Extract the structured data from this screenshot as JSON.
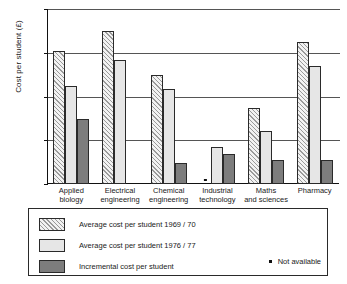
{
  "chart_data": {
    "type": "bar",
    "title": "",
    "xlabel": "",
    "ylabel": "Cost per student (£)",
    "ylim": [
      0,
      4000
    ],
    "yticks": [
      0,
      1000,
      2000,
      3000,
      4000
    ],
    "ytick_labels": [
      "0",
      "1000",
      "2000",
      "3000",
      "4000"
    ],
    "grid": true,
    "legend_position": "below-plot-boxed",
    "categories": [
      "Applied biology",
      "Electrical engineering",
      "Chemical engineering",
      "Industrial technology",
      "Maths and sciences",
      "Pharmacy"
    ],
    "category_lines": [
      [
        "Applied",
        "biology"
      ],
      [
        "Electrical",
        "engineering"
      ],
      [
        "Chemical",
        "engineering"
      ],
      [
        "Industrial",
        "technology"
      ],
      [
        "Maths",
        "and sciences"
      ],
      [
        "Pharmacy",
        ""
      ]
    ],
    "series": [
      {
        "name": "Average cost per student  1969 / 70",
        "key": "avg1969",
        "pattern": "diagonal-hatch",
        "values": [
          3030,
          3500,
          2500,
          null,
          1730,
          3250
        ]
      },
      {
        "name": "Average cost per student  1976 / 77",
        "key": "avg1976",
        "pattern": "fine-grid",
        "values": [
          2250,
          2840,
          2170,
          850,
          1220,
          2700
        ]
      },
      {
        "name": "Incremental cost per student",
        "key": "incremental",
        "pattern": "solid-grey",
        "values": [
          1490,
          null,
          470,
          690,
          560,
          560
        ]
      }
    ],
    "annotations": [
      {
        "text": "Not available",
        "marker": "dot",
        "applies_to": "Industrial technology 1969 / 70"
      }
    ]
  },
  "legend": {
    "items": [
      {
        "label": "Average cost per student  1969 / 70",
        "pattern": "diagonal-hatch"
      },
      {
        "label": "Average cost per student  1976 / 77",
        "pattern": "fine-grid"
      },
      {
        "label": "Incremental cost per student",
        "pattern": "solid-grey"
      }
    ],
    "note": "Not available"
  },
  "colors": {
    "axis": "#111111",
    "grid": "#555555",
    "hatch": "#9a9a9a",
    "fine_grid_fill": "#e6e6e6",
    "solid_grey": "#7d7d7d",
    "background": "#ffffff"
  }
}
